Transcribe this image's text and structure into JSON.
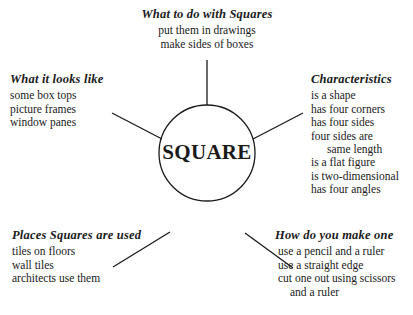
{
  "center": {
    "label": "SQUARE"
  },
  "branches": {
    "top": {
      "heading": "What to do with Squares",
      "items": [
        "put them in drawings",
        "make sides of boxes"
      ]
    },
    "upper_left": {
      "heading": "What it looks like",
      "items": [
        "some box tops",
        "picture frames",
        "window panes"
      ]
    },
    "upper_right": {
      "heading": "Characteristics",
      "items": [
        "is a shape",
        "has four corners",
        "has four sides",
        "four sides are",
        "same length",
        "is a flat figure",
        "is two-dimensional",
        "has four angles"
      ]
    },
    "lower_left": {
      "heading": "Places Squares are used",
      "items": [
        "tiles on floors",
        "wall tiles",
        "architects use them"
      ]
    },
    "lower_right": {
      "heading": "How do you make one",
      "items": [
        "use a pencil and a ruler",
        "use a straight edge",
        "cut one out using scissors",
        "and a ruler"
      ]
    }
  }
}
